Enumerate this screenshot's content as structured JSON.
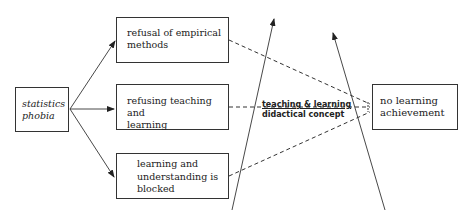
{
  "diagram": {
    "nodes": {
      "statistics_phobia": {
        "line1": "statistics",
        "line2": "phobia"
      },
      "refusal_methods": {
        "line1": "refusal of empirical",
        "line2": "methods"
      },
      "refusing_teaching": {
        "line1": "refusing teaching and",
        "line2": "learning"
      },
      "learning_blocked": {
        "line1": "learning and",
        "line2": "understanding is",
        "line3": "blocked"
      },
      "no_learning": {
        "line1": "no learning",
        "line2": "achievement"
      }
    },
    "intervention_label": {
      "line1": "teaching & learning",
      "line2": "didactical concept"
    },
    "edges": [
      {
        "from": "statistics_phobia",
        "to": "refusal_methods",
        "style": "solid-arrow"
      },
      {
        "from": "statistics_phobia",
        "to": "refusing_teaching",
        "style": "solid-arrow"
      },
      {
        "from": "statistics_phobia",
        "to": "learning_blocked",
        "style": "solid-arrow"
      },
      {
        "from": "refusal_methods",
        "to": "no_learning",
        "style": "dashed"
      },
      {
        "from": "refusing_teaching",
        "to": "no_learning",
        "style": "dashed"
      },
      {
        "from": "learning_blocked",
        "to": "no_learning",
        "style": "dashed"
      }
    ],
    "colors": {
      "line": "#333333",
      "background": "#ffffff"
    }
  }
}
